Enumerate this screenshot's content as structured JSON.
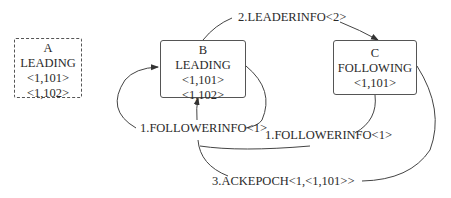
{
  "nodes": [
    {
      "id": "A",
      "name": "A",
      "state": "LEADING",
      "votes": [
        "<1,101>",
        "<1,102>"
      ],
      "border": "dashed"
    },
    {
      "id": "B",
      "name": "B",
      "state": "LEADING",
      "votes": [
        "<1,101>",
        "<1,102>"
      ],
      "border": "solid"
    },
    {
      "id": "C",
      "name": "C",
      "state": "FOLLOWING",
      "votes": [
        "<1,101>"
      ],
      "border": "solid"
    }
  ],
  "edges": [
    {
      "label": "1.FOLLOWERINFO<1>",
      "from": "B",
      "to": "B",
      "note": "self-loop on left side of B"
    },
    {
      "label": "1.FOLLOWERINFO<1>",
      "from": "C",
      "to": "B"
    },
    {
      "label": "2.LEADERINFO<2>",
      "from": "B",
      "to": "C"
    },
    {
      "label": "3.ACKEPOCH<1,<1,101>>",
      "from": "C",
      "to": "B"
    }
  ],
  "colors": {
    "line": "#444444",
    "text": "#2a2a2a",
    "background": "#ffffff"
  }
}
